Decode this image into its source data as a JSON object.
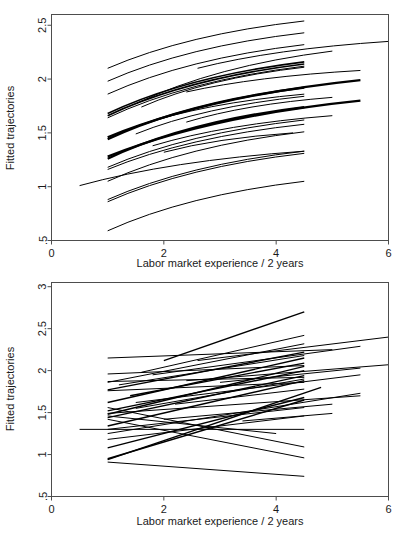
{
  "figure": {
    "background": "#ffffff",
    "line_color": "#000000",
    "axis_color": "#4d4d4d",
    "panel_count": 2
  },
  "chart_data": [
    {
      "panel": "top",
      "type": "line",
      "title": "",
      "xlabel": "Labor market experience / 2 years",
      "ylabel": "Fitted trajectories",
      "xlim": [
        0,
        6
      ],
      "ylim": [
        0.5,
        2.6
      ],
      "xticks": [
        0,
        2,
        4,
        6
      ],
      "xtick_labels": [
        "0",
        "2",
        "4",
        "6"
      ],
      "yticks": [
        0.5,
        1,
        1.5,
        2,
        2.5
      ],
      "ytick_labels": [
        ".5",
        "1",
        "1.5",
        "2",
        "2.5"
      ],
      "grid": false,
      "legend": "none",
      "curve_shape": "concave-increasing",
      "series": [
        {
          "name": "s1",
          "x": [
            1.0,
            4.5
          ],
          "y": [
            2.1,
            2.54
          ],
          "width": 1.0
        },
        {
          "name": "s2",
          "x": [
            1.0,
            4.5
          ],
          "y": [
            1.98,
            2.43
          ],
          "width": 1.0
        },
        {
          "name": "s3",
          "x": [
            1.0,
            4.5
          ],
          "y": [
            1.86,
            2.32
          ],
          "width": 1.0
        },
        {
          "name": "s4",
          "x": [
            2.6,
            6.0
          ],
          "y": [
            2.1,
            2.35
          ],
          "width": 1.0
        },
        {
          "name": "s5",
          "x": [
            1.5,
            5.0
          ],
          "y": [
            1.77,
            2.26
          ],
          "width": 1.0
        },
        {
          "name": "s6",
          "x": [
            1.0,
            4.5
          ],
          "y": [
            1.68,
            2.16
          ],
          "width": 1.6
        },
        {
          "name": "s7",
          "x": [
            1.0,
            4.5
          ],
          "y": [
            1.66,
            2.14
          ],
          "width": 1.6
        },
        {
          "name": "s8",
          "x": [
            1.0,
            4.5
          ],
          "y": [
            1.64,
            2.12
          ],
          "width": 1.0
        },
        {
          "name": "s9",
          "x": [
            1.6,
            4.5
          ],
          "y": [
            1.74,
            2.11
          ],
          "width": 1.0
        },
        {
          "name": "s10",
          "x": [
            2.4,
            5.5
          ],
          "y": [
            1.88,
            2.08
          ],
          "width": 1.0
        },
        {
          "name": "s11",
          "x": [
            1.0,
            5.5
          ],
          "y": [
            1.46,
            1.99
          ],
          "width": 2.2
        },
        {
          "name": "s12",
          "x": [
            1.0,
            4.5
          ],
          "y": [
            1.44,
            1.92
          ],
          "width": 2.2
        },
        {
          "name": "s13",
          "x": [
            1.5,
            4.5
          ],
          "y": [
            1.56,
            1.86
          ],
          "width": 1.0
        },
        {
          "name": "s14",
          "x": [
            1.5,
            4.5
          ],
          "y": [
            1.49,
            1.84
          ],
          "width": 1.0
        },
        {
          "name": "s15",
          "x": [
            2.4,
            5.0
          ],
          "y": [
            1.6,
            1.83
          ],
          "width": 1.0
        },
        {
          "name": "s16",
          "x": [
            1.0,
            5.5
          ],
          "y": [
            1.28,
            1.8
          ],
          "width": 2.2
        },
        {
          "name": "s17",
          "x": [
            1.0,
            4.5
          ],
          "y": [
            1.26,
            1.74
          ],
          "width": 2.2
        },
        {
          "name": "s18",
          "x": [
            1.8,
            5.0
          ],
          "y": [
            1.38,
            1.66
          ],
          "width": 1.0
        },
        {
          "name": "s19",
          "x": [
            1.0,
            4.5
          ],
          "y": [
            1.18,
            1.62
          ],
          "width": 1.0
        },
        {
          "name": "s20",
          "x": [
            1.0,
            4.5
          ],
          "y": [
            1.16,
            1.58
          ],
          "width": 1.0
        },
        {
          "name": "s21",
          "x": [
            1.0,
            4.5
          ],
          "y": [
            1.05,
            1.51
          ],
          "width": 1.0
        },
        {
          "name": "s22",
          "x": [
            2.0,
            4.3
          ],
          "y": [
            1.32,
            1.5
          ],
          "width": 1.0
        },
        {
          "name": "s23",
          "x": [
            0.5,
            4.5
          ],
          "y": [
            1.01,
            1.33
          ],
          "width": 1.0
        },
        {
          "name": "s24",
          "x": [
            1.0,
            4.5
          ],
          "y": [
            0.88,
            1.33
          ],
          "width": 1.0
        },
        {
          "name": "s25",
          "x": [
            1.0,
            4.5
          ],
          "y": [
            0.86,
            1.31
          ],
          "width": 1.0
        },
        {
          "name": "s26",
          "x": [
            1.0,
            4.5
          ],
          "y": [
            0.59,
            1.05
          ],
          "width": 1.0
        }
      ]
    },
    {
      "panel": "bottom",
      "type": "line",
      "title": "",
      "xlabel": "Labor market experience / 2 years",
      "ylabel": "Fitted trajectories",
      "xlim": [
        0,
        6
      ],
      "ylim": [
        0.5,
        3.05
      ],
      "xticks": [
        0,
        2,
        4,
        6
      ],
      "xtick_labels": [
        "0",
        "2",
        "4",
        "6"
      ],
      "yticks": [
        0.5,
        1,
        1.5,
        2,
        2.5,
        3
      ],
      "ytick_labels": [
        ".5",
        "1",
        "1.5",
        "2",
        "2.5",
        "3"
      ],
      "grid": false,
      "legend": "none",
      "curve_shape": "straight",
      "series": [
        {
          "name": "b1",
          "x": [
            2.0,
            4.5
          ],
          "y": [
            2.12,
            2.7
          ],
          "width": 1.4
        },
        {
          "name": "b2",
          "x": [
            1.6,
            4.5
          ],
          "y": [
            1.98,
            2.42
          ],
          "width": 1.0
        },
        {
          "name": "b3",
          "x": [
            2.6,
            6.0
          ],
          "y": [
            2.12,
            2.4
          ],
          "width": 1.0
        },
        {
          "name": "b4",
          "x": [
            1.0,
            4.5
          ],
          "y": [
            1.86,
            2.32
          ],
          "width": 1.0
        },
        {
          "name": "b5",
          "x": [
            1.8,
            5.5
          ],
          "y": [
            1.95,
            2.29
          ],
          "width": 1.0
        },
        {
          "name": "b6",
          "x": [
            1.0,
            5.0
          ],
          "y": [
            2.15,
            2.25
          ],
          "width": 1.0
        },
        {
          "name": "b7",
          "x": [
            1.0,
            4.5
          ],
          "y": [
            1.77,
            2.22
          ],
          "width": 1.4
        },
        {
          "name": "b8",
          "x": [
            1.2,
            4.5
          ],
          "y": [
            1.83,
            2.18
          ],
          "width": 1.0
        },
        {
          "name": "b9",
          "x": [
            1.0,
            4.5
          ],
          "y": [
            1.62,
            2.15
          ],
          "width": 1.4
        },
        {
          "name": "b10",
          "x": [
            1.4,
            4.5
          ],
          "y": [
            1.7,
            2.09
          ],
          "width": 1.4
        },
        {
          "name": "b11",
          "x": [
            2.4,
            6.0
          ],
          "y": [
            1.88,
            2.07
          ],
          "width": 1.0
        },
        {
          "name": "b12",
          "x": [
            1.0,
            4.5
          ],
          "y": [
            1.96,
            2.06
          ],
          "width": 1.0
        },
        {
          "name": "b13",
          "x": [
            1.0,
            4.5
          ],
          "y": [
            1.48,
            2.05
          ],
          "width": 1.4
        },
        {
          "name": "b14",
          "x": [
            3.0,
            5.5
          ],
          "y": [
            1.86,
            2.03
          ],
          "width": 1.0
        },
        {
          "name": "b15",
          "x": [
            1.0,
            4.5
          ],
          "y": [
            1.52,
            2.0
          ],
          "width": 1.4
        },
        {
          "name": "b16",
          "x": [
            1.5,
            5.5
          ],
          "y": [
            1.62,
            1.95
          ],
          "width": 1.0
        },
        {
          "name": "b17",
          "x": [
            1.0,
            4.5
          ],
          "y": [
            1.44,
            1.94
          ],
          "width": 1.4
        },
        {
          "name": "b18",
          "x": [
            1.0,
            4.5
          ],
          "y": [
            1.87,
            1.92
          ],
          "width": 1.0
        },
        {
          "name": "b19",
          "x": [
            1.5,
            4.5
          ],
          "y": [
            1.55,
            1.9
          ],
          "width": 1.0
        },
        {
          "name": "b20",
          "x": [
            1.0,
            4.5
          ],
          "y": [
            1.34,
            1.88
          ],
          "width": 1.4
        },
        {
          "name": "b21",
          "x": [
            1.0,
            4.5
          ],
          "y": [
            1.76,
            1.86
          ],
          "width": 1.0
        },
        {
          "name": "b22",
          "x": [
            1.0,
            4.8
          ],
          "y": [
            0.94,
            1.8
          ],
          "width": 1.4
        },
        {
          "name": "b23",
          "x": [
            2.2,
            4.5
          ],
          "y": [
            1.6,
            1.78
          ],
          "width": 1.0
        },
        {
          "name": "b24",
          "x": [
            1.0,
            5.5
          ],
          "y": [
            1.25,
            1.73
          ],
          "width": 1.0
        },
        {
          "name": "b25",
          "x": [
            1.0,
            5.5
          ],
          "y": [
            1.49,
            1.7
          ],
          "width": 1.0
        },
        {
          "name": "b26",
          "x": [
            1.0,
            4.5
          ],
          "y": [
            1.08,
            1.68
          ],
          "width": 1.4
        },
        {
          "name": "b27",
          "x": [
            1.0,
            4.5
          ],
          "y": [
            0.95,
            1.65
          ],
          "width": 1.4
        },
        {
          "name": "b28",
          "x": [
            2.0,
            5.0
          ],
          "y": [
            1.42,
            1.6
          ],
          "width": 1.0
        },
        {
          "name": "b29",
          "x": [
            1.0,
            4.5
          ],
          "y": [
            1.3,
            1.56
          ],
          "width": 1.0
        },
        {
          "name": "b30",
          "x": [
            3.4,
            5.0
          ],
          "y": [
            1.4,
            1.49
          ],
          "width": 1.0
        },
        {
          "name": "b31",
          "x": [
            1.0,
            4.5
          ],
          "y": [
            1.18,
            1.46
          ],
          "width": 1.0
        },
        {
          "name": "b32",
          "x": [
            0.5,
            4.5
          ],
          "y": [
            1.3,
            1.3
          ],
          "width": 1.0
        },
        {
          "name": "b33",
          "x": [
            1.0,
            4.0
          ],
          "y": [
            1.46,
            1.25
          ],
          "width": 1.0
        },
        {
          "name": "b34",
          "x": [
            1.0,
            4.5
          ],
          "y": [
            1.56,
            1.09
          ],
          "width": 1.0
        },
        {
          "name": "b35",
          "x": [
            1.0,
            4.5
          ],
          "y": [
            1.42,
            0.96
          ],
          "width": 1.0
        },
        {
          "name": "b36",
          "x": [
            1.0,
            4.5
          ],
          "y": [
            0.91,
            0.74
          ],
          "width": 1.0
        }
      ]
    }
  ]
}
